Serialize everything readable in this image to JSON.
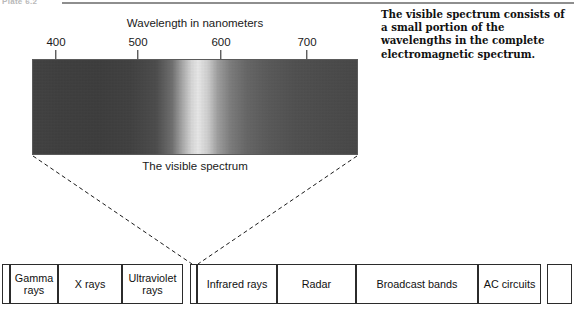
{
  "plate": {
    "label": "Plate 6.2"
  },
  "description": {
    "text": "The visible spectrum consists of a small portion of the wavelengths in the complete electromagnetic spectrum."
  },
  "chart_data": {
    "type": "heatmap",
    "title": "Wavelength in nanometers",
    "xlabel": "Wavelength in nanometers",
    "ylabel": "",
    "caption": "The visible spectrum",
    "xlim": [
      380,
      760
    ],
    "grid": false,
    "legend_position": "none",
    "tick_labels": [
      "400",
      "500",
      "600",
      "700"
    ],
    "tick_values": [
      400,
      500,
      600,
      700
    ],
    "tick_positions_px": [
      56,
      138,
      221,
      307
    ],
    "band": {
      "left_px": 32,
      "right_px": 358,
      "top_px": 59,
      "bottom_px": 155,
      "rendering": "grayscale",
      "stops": [
        {
          "pos_pct": 0,
          "color": "#3f3f3f"
        },
        {
          "pos_pct": 20,
          "color": "#3a3a3a"
        },
        {
          "pos_pct": 38,
          "color": "#4a4a4a"
        },
        {
          "pos_pct": 46,
          "color": "#a8a8a8"
        },
        {
          "pos_pct": 51,
          "color": "#ededed"
        },
        {
          "pos_pct": 57,
          "color": "#a0a0a0"
        },
        {
          "pos_pct": 73,
          "color": "#575757"
        },
        {
          "pos_pct": 100,
          "color": "#454545"
        }
      ]
    },
    "em_bands": {
      "type": "table",
      "categories": [
        "Gamma rays",
        "X rays",
        "Ultraviolet rays",
        "",
        "Infrared rays",
        "Radar",
        "Broadcast bands",
        "AC circuits"
      ],
      "cells": [
        {
          "label": "",
          "left_px": 0,
          "width_px": 8
        },
        {
          "label": "Gamma rays",
          "left_px": 8,
          "width_px": 48
        },
        {
          "label": "X rays",
          "left_px": 56,
          "width_px": 64
        },
        {
          "label": "Ultraviolet rays",
          "left_px": 120,
          "width_px": 61
        },
        {
          "label": "",
          "left_px": 188,
          "width_px": 7
        },
        {
          "label": "Infrared rays",
          "left_px": 195,
          "width_px": 80
        },
        {
          "label": "Radar",
          "left_px": 275,
          "width_px": 79
        },
        {
          "label": "Broadcast bands",
          "left_px": 354,
          "width_px": 122
        },
        {
          "label": "AC circuits",
          "left_px": 476,
          "width_px": 63
        },
        {
          "label": "",
          "left_px": 545,
          "width_px": 25
        }
      ]
    }
  },
  "colors": {
    "ink": "#101010",
    "rule": "#8e8e8e",
    "border": "#2b2b2b"
  }
}
